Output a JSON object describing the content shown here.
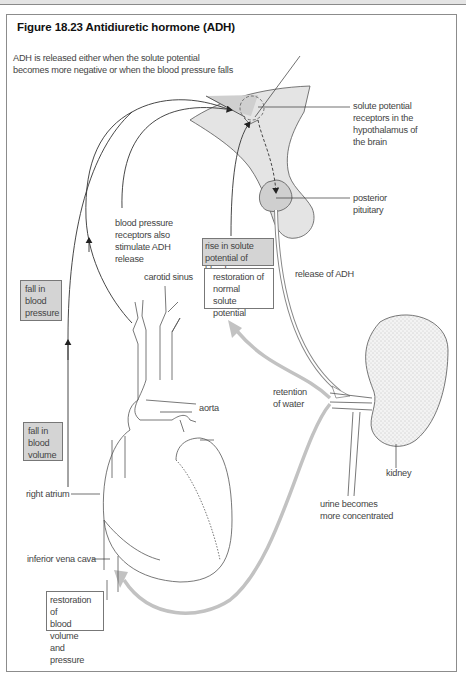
{
  "figure": {
    "title": "Figure 18.23  Antidiuretic hormone (ADH)"
  },
  "labels": {
    "intro": [
      "ADH is released either when the solute potential",
      "becomes more negative or when the blood pressure falls"
    ],
    "solute_receptors": [
      "solute potential",
      "receptors in the",
      "hypothalamus of",
      "the brain"
    ],
    "posterior_pituitary": [
      "posterior",
      "pituitary"
    ],
    "bp_receptors": [
      "blood pressure",
      "receptors also",
      "stimulate ADH",
      "release"
    ],
    "carotid_sinus": "carotid sinus",
    "release_of_adh": "release of ADH",
    "aorta": "aorta",
    "retention_of_water": [
      "retention",
      "of water"
    ],
    "kidney": "kidney",
    "right_atrium": "right atrium",
    "urine_concentrated": [
      "urine becomes",
      "more concentrated"
    ],
    "inferior_vena_cava": "inferior vena cava"
  },
  "boxes": {
    "fall_blood_pressure": [
      "fall in",
      "blood",
      "pressure"
    ],
    "fall_blood_volume": [
      "fall in",
      "blood",
      "volume"
    ],
    "rise_solute": [
      "rise in solute",
      "potential of blood"
    ],
    "restoration_solute": [
      "restoration of",
      "normal solute",
      "potential"
    ],
    "restoration_volume": [
      "restoration of",
      "blood volume",
      "and pressure"
    ]
  },
  "colors": {
    "frame": "#8c8c8c",
    "shaded_box": "#d4d4d4",
    "brain_fill": "#e2e2e2",
    "receptor_fill": "#cfcfcf",
    "gray_arrow": "#bdbdbd",
    "line": "#333333"
  }
}
